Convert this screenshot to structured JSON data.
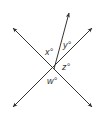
{
  "diagram": {
    "line_color": "#333333",
    "background": "#ffffff",
    "intersection": [
      54,
      69
    ],
    "lines": [
      {
        "name": "line-1",
        "from": [
          13,
          28
        ],
        "to": [
          92,
          107
        ],
        "arrows": "both"
      },
      {
        "name": "line-2",
        "from": [
          92,
          28
        ],
        "to": [
          13,
          107
        ],
        "arrows": "both"
      }
    ],
    "rays": [
      {
        "name": "ray-up",
        "from": [
          54,
          69
        ],
        "to": [
          69,
          13
        ],
        "arrows": "end"
      }
    ],
    "angle_labels": [
      {
        "id": "x",
        "text": "x°",
        "pos": [
          45,
          55
        ]
      },
      {
        "id": "y",
        "text": "y°",
        "pos": [
          63,
          48
        ]
      },
      {
        "id": "z",
        "text": "z°",
        "pos": [
          62,
          70
        ]
      },
      {
        "id": "w",
        "text": "w°",
        "pos": [
          47,
          84
        ]
      }
    ]
  }
}
